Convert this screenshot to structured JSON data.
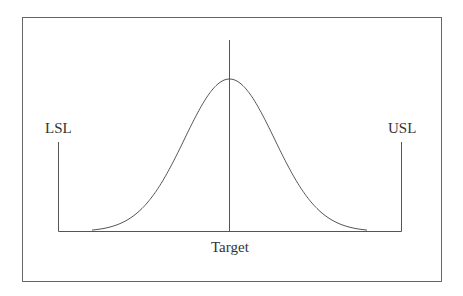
{
  "diagram": {
    "labels": {
      "lsl": "LSL",
      "usl": "USL",
      "target": "Target"
    },
    "colors": {
      "line": "#555555",
      "frame": "#666666",
      "background": "#ffffff"
    }
  },
  "chart_data": {
    "type": "line",
    "title": "",
    "xlabel": "",
    "ylabel": "",
    "series": [
      {
        "name": "Normal distribution curve",
        "shape": "bell",
        "center": "Target"
      }
    ],
    "annotations": [
      {
        "text": "LSL",
        "position": "left vertical limit line"
      },
      {
        "text": "USL",
        "position": "right vertical limit line"
      },
      {
        "text": "Target",
        "position": "center vertical line below baseline"
      }
    ],
    "grid": false
  }
}
